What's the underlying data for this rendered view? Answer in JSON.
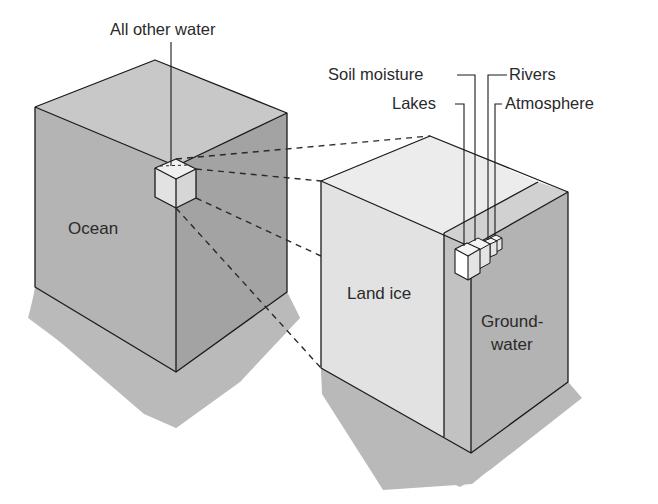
{
  "diagram": {
    "colors": {
      "background": "#ffffff",
      "ocean_top": "#c9c9c9",
      "ocean_left": "#b5b5b5",
      "ocean_right": "#a6a6a6",
      "landice_top": "#ececec",
      "landice_front": "#e3e3e3",
      "groundwater_strip": "#c4c4c4",
      "groundwater_top": "#d2d2d2",
      "groundwater_face": "#b4b4b4",
      "small_cube_top": "#f4f4f4",
      "small_cube_left": "#ffffff",
      "small_cube_right": "#e6e6e6",
      "shadow": "#b9b9b9",
      "line": "#1a1a1a"
    },
    "blocks": [
      {
        "id": "ocean",
        "label": "Ocean"
      },
      {
        "id": "land_ice",
        "label": "Land ice"
      },
      {
        "id": "groundwater",
        "label_line1": "Ground-",
        "label_line2": "water"
      }
    ],
    "callouts": {
      "all_other_water": "All other water",
      "soil_moisture": "Soil moisture",
      "lakes": "Lakes",
      "rivers": "Rivers",
      "atmosphere": "Atmosphere"
    }
  }
}
